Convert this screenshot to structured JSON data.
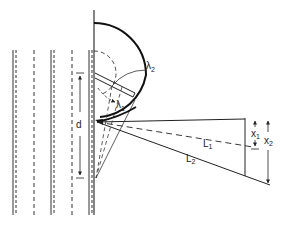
{
  "diagram": {
    "type": "geometric-optics-schematic",
    "labels": {
      "lambda2": {
        "main": "λ",
        "sub": "2"
      },
      "lambda1": {
        "main": "λ",
        "sub": "1"
      },
      "d": {
        "main": "d"
      },
      "L1": {
        "main": "L",
        "sub": "1"
      },
      "L2": {
        "main": "L",
        "sub": "2"
      },
      "x1": {
        "main": "x",
        "sub": "1"
      },
      "x2": {
        "main": "x",
        "sub": "2"
      }
    },
    "colors": {
      "background": "#ffffff",
      "ink": "#222222"
    }
  }
}
